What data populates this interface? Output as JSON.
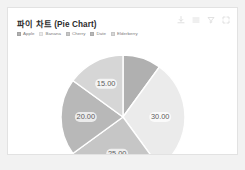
{
  "card": {
    "title": "파이 차트 (Pie Chart)"
  },
  "toolbar": {
    "items": [
      {
        "name": "download-icon",
        "label": "Download"
      },
      {
        "name": "menu-icon",
        "label": "Menu"
      },
      {
        "name": "filter-icon",
        "label": "Filter"
      },
      {
        "name": "expand-icon",
        "label": "Expand"
      }
    ]
  },
  "legend": {
    "items": [
      {
        "label": "Apple",
        "color": "#b0b0b0"
      },
      {
        "label": "Banana",
        "color": "#ebebeb"
      },
      {
        "label": "Cherry",
        "color": "#c6c6c6"
      },
      {
        "label": "Date",
        "color": "#b8b8b8"
      },
      {
        "label": "Elderberry",
        "color": "#d6d6d6"
      }
    ]
  },
  "chart_data": {
    "type": "pie",
    "title": "파이 차트 (Pie Chart)",
    "categories": [
      "Apple",
      "Banana",
      "Cherry",
      "Date",
      "Elderberry"
    ],
    "values": [
      10,
      30,
      25,
      20,
      15
    ],
    "labels": [
      "",
      "30.00",
      "25.00",
      "20.00",
      "15.00"
    ],
    "colors": [
      "#b0b0b0",
      "#ebebeb",
      "#c6c6c6",
      "#b8b8b8",
      "#d6d6d6"
    ],
    "total": 100,
    "label_format": "0.00",
    "legend_position": "top-left",
    "start_angle_deg": 0,
    "direction": "clockwise",
    "stroke_color": "#ffffff",
    "grid": false
  }
}
